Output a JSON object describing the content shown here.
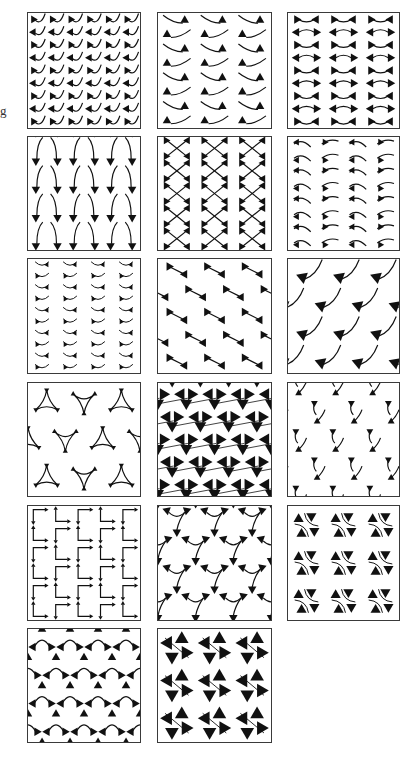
{
  "figure": {
    "edge_text": "g",
    "ink_color": "#111111",
    "border_color": "#3a3a3a",
    "panel_count": 17,
    "panels": [
      {
        "id": 1,
        "row": 1,
        "col": 1,
        "x": 27,
        "y": 12,
        "w": 114,
        "h": 117,
        "motif": "zigzag-triangles",
        "grid": {
          "cols": 6,
          "rows": 9
        }
      },
      {
        "id": 2,
        "row": 1,
        "col": 2,
        "x": 157,
        "y": 12,
        "w": 115,
        "h": 117,
        "motif": "hook-triangle",
        "grid": {
          "cols": 3,
          "rows": 8
        }
      },
      {
        "id": 3,
        "row": 1,
        "col": 3,
        "x": 287,
        "y": 12,
        "w": 113,
        "h": 117,
        "motif": "bowtie-wave",
        "grid": {
          "cols": 3,
          "rows": 9
        }
      },
      {
        "id": 4,
        "row": 2,
        "col": 1,
        "x": 27,
        "y": 136,
        "w": 114,
        "h": 115,
        "motif": "v-horns",
        "grid": {
          "cols": 3,
          "rows": 4
        }
      },
      {
        "id": 5,
        "row": 2,
        "col": 2,
        "x": 157,
        "y": 136,
        "w": 115,
        "h": 115,
        "motif": "crossed-bowtie",
        "grid": {
          "cols": 3,
          "rows": 5
        }
      },
      {
        "id": 6,
        "row": 2,
        "col": 3,
        "x": 287,
        "y": 136,
        "w": 113,
        "h": 115,
        "motif": "eye-hooks",
        "grid": {
          "cols": 4,
          "rows": 8
        }
      },
      {
        "id": 7,
        "row": 3,
        "col": 1,
        "x": 27,
        "y": 258,
        "w": 114,
        "h": 116,
        "motif": "small-hooks",
        "grid": {
          "cols": 4,
          "rows": 10
        }
      },
      {
        "id": 8,
        "row": 3,
        "col": 2,
        "x": 157,
        "y": 258,
        "w": 115,
        "h": 116,
        "motif": "diagonal-bowtie",
        "grid": {
          "cols": 3,
          "rows": 5
        }
      },
      {
        "id": 9,
        "row": 3,
        "col": 3,
        "x": 287,
        "y": 258,
        "w": 113,
        "h": 116,
        "motif": "fin-arc",
        "grid": {
          "cols": 3,
          "rows": 4
        }
      },
      {
        "id": 10,
        "row": 4,
        "col": 1,
        "x": 27,
        "y": 382,
        "w": 114,
        "h": 115,
        "motif": "triangle-frames",
        "grid": {
          "cols": 3,
          "rows": 3
        }
      },
      {
        "id": 11,
        "row": 4,
        "col": 2,
        "x": 157,
        "y": 382,
        "w": 115,
        "h": 115,
        "motif": "kagome-triangles",
        "grid": {
          "cols": 4,
          "rows": 5
        }
      },
      {
        "id": 12,
        "row": 4,
        "col": 3,
        "x": 287,
        "y": 382,
        "w": 113,
        "h": 115,
        "motif": "scattered-flags",
        "grid": {
          "cols": 3,
          "rows": 4
        }
      },
      {
        "id": 13,
        "row": 5,
        "col": 1,
        "x": 27,
        "y": 505,
        "w": 114,
        "h": 116,
        "motif": "square-corners",
        "grid": {
          "cols": 5,
          "rows": 6
        }
      },
      {
        "id": 14,
        "row": 5,
        "col": 2,
        "x": 157,
        "y": 505,
        "w": 115,
        "h": 116,
        "motif": "tri-curves",
        "grid": {
          "cols": 3,
          "rows": 4
        }
      },
      {
        "id": 15,
        "row": 5,
        "col": 3,
        "x": 287,
        "y": 505,
        "w": 113,
        "h": 116,
        "motif": "quad-rosette",
        "grid": {
          "cols": 3,
          "rows": 3
        }
      },
      {
        "id": 16,
        "row": 6,
        "col": 1,
        "x": 27,
        "y": 628,
        "w": 114,
        "h": 115,
        "motif": "arch-triangles",
        "grid": {
          "cols": 4,
          "rows": 4
        }
      },
      {
        "id": 17,
        "row": 6,
        "col": 2,
        "x": 157,
        "y": 628,
        "w": 115,
        "h": 115,
        "motif": "pinwheel",
        "grid": {
          "cols": 3,
          "rows": 3
        }
      }
    ]
  }
}
